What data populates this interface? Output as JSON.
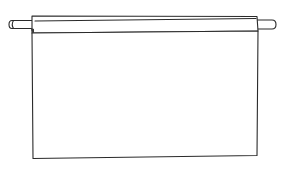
{
  "illustration": {
    "subject": "blank hanging banner on a rod",
    "ink_color": "#2a2a2a",
    "background_color": "#ffffff",
    "banner_text": ""
  }
}
